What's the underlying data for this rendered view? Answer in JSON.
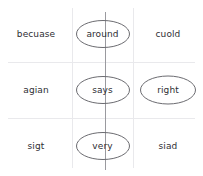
{
  "worksheet": {
    "title": "Spelling word grid",
    "colors": {
      "gridline": "#e9e9ec",
      "center_line": "#9a9a9f",
      "circle_stroke": "#6b6b70",
      "text": "#2e2e33",
      "background": "#ffffff"
    },
    "grid": {
      "rows": 3,
      "columns": 3
    },
    "cells": [
      {
        "row": 0,
        "column": 0,
        "word": "becuase",
        "circled": false
      },
      {
        "row": 0,
        "column": 1,
        "word": "around",
        "circled": true
      },
      {
        "row": 0,
        "column": 2,
        "word": "cuold",
        "circled": false
      },
      {
        "row": 1,
        "column": 0,
        "word": "agian",
        "circled": false
      },
      {
        "row": 1,
        "column": 1,
        "word": "says",
        "circled": true
      },
      {
        "row": 1,
        "column": 2,
        "word": "right",
        "circled": true
      },
      {
        "row": 2,
        "column": 0,
        "word": "sigt",
        "circled": false
      },
      {
        "row": 2,
        "column": 1,
        "word": "very",
        "circled": true
      },
      {
        "row": 2,
        "column": 2,
        "word": "siad",
        "circled": false
      }
    ]
  }
}
